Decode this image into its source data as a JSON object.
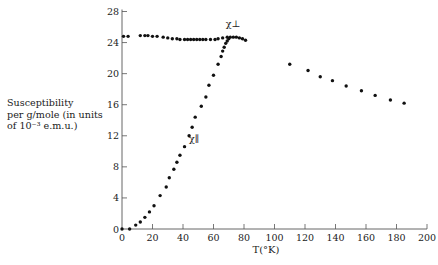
{
  "chart_data": {
    "type": "scatter",
    "title": "",
    "xlabel": "T(°K)",
    "ylabel": "Susceptibility per g/mole (in units of 10⁻³ e.m.u.)",
    "ylabel_lines": [
      "Susceptibility",
      "per g/mole (in units",
      "of 10⁻³ e.m.u.)"
    ],
    "xlim": [
      0,
      200
    ],
    "ylim": [
      0,
      28
    ],
    "xticks": [
      0,
      20,
      40,
      60,
      80,
      100,
      120,
      140,
      160,
      180,
      200
    ],
    "yticks": [
      0,
      4,
      8,
      12,
      16,
      20,
      24,
      28
    ],
    "grid": false,
    "legend": "inline labels",
    "annotations": [
      {
        "text": "χ⊥",
        "x": 68,
        "y": 26.0
      },
      {
        "text": "χ∥",
        "x": 44,
        "y": 11.2
      }
    ],
    "series": [
      {
        "name": "χ⊥",
        "x": [
          1,
          4,
          12,
          15,
          17,
          20,
          23,
          27,
          30,
          33,
          36,
          38,
          41,
          43,
          45,
          47,
          49,
          51,
          53,
          55,
          58,
          61,
          63,
          66,
          69,
          71,
          73,
          75,
          77,
          79,
          81
        ],
        "y": [
          24.8,
          24.8,
          24.9,
          24.9,
          24.9,
          24.8,
          24.8,
          24.7,
          24.6,
          24.5,
          24.5,
          24.4,
          24.4,
          24.4,
          24.4,
          24.4,
          24.4,
          24.4,
          24.4,
          24.4,
          24.4,
          24.4,
          24.5,
          24.6,
          24.7,
          24.7,
          24.7,
          24.7,
          24.6,
          24.5,
          24.3
        ]
      },
      {
        "name": "χ∥",
        "x": [
          0,
          5,
          9,
          12,
          15,
          18,
          21,
          25,
          29,
          31,
          34,
          36,
          38,
          41,
          44,
          46,
          48,
          52,
          55,
          57,
          60,
          63,
          65,
          66,
          67,
          68,
          69,
          70
        ],
        "y": [
          0,
          0,
          0.5,
          0.9,
          1.5,
          2.2,
          3.0,
          4.3,
          5.4,
          6.6,
          7.7,
          8.6,
          9.5,
          10.6,
          12.0,
          13.1,
          14.4,
          15.8,
          17.0,
          18.5,
          19.8,
          21.2,
          22.2,
          22.9,
          23.4,
          23.9,
          24.2,
          24.5
        ]
      },
      {
        "name": "paramagnetic (T > T_N)",
        "x": [
          110,
          122,
          130,
          138,
          147,
          157,
          166,
          176,
          185
        ],
        "y": [
          21.2,
          20.4,
          19.6,
          19.1,
          18.4,
          17.8,
          17.2,
          16.6,
          16.2
        ]
      }
    ]
  }
}
